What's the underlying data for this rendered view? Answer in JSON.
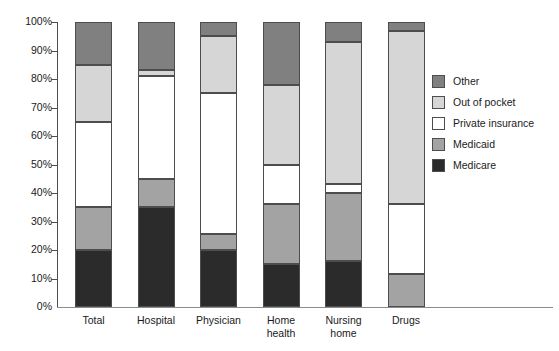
{
  "chart_data": {
    "type": "bar",
    "stacked": true,
    "title": "",
    "subtitle": "",
    "xlabel": "",
    "ylabel": "",
    "ylim": [
      0,
      100
    ],
    "grid": false,
    "legend_position": "right",
    "y_ticks": [
      "0%",
      "10%",
      "20%",
      "30%",
      "40%",
      "50%",
      "60%",
      "70%",
      "80%",
      "90%",
      "100%"
    ],
    "y_tick_values": [
      0,
      10,
      20,
      30,
      40,
      50,
      60,
      70,
      80,
      90,
      100
    ],
    "categories": [
      "Total",
      "Hospital",
      "Physician",
      "Home\nhealth",
      "Nursing\nhome",
      "Drugs"
    ],
    "series": [
      {
        "name": "Medicare",
        "color": "#2b2b2b",
        "values": [
          20,
          35,
          20,
          15,
          16,
          0
        ]
      },
      {
        "name": "Medicaid",
        "color": "#a3a3a3",
        "values": [
          15,
          10,
          5.5,
          21,
          24,
          11.5
        ]
      },
      {
        "name": "Private insurance",
        "color": "#ffffff",
        "values": [
          30,
          36,
          49.5,
          14,
          3,
          24.5
        ]
      },
      {
        "name": "Out of pocket",
        "color": "#d6d6d6",
        "values": [
          20,
          2,
          20,
          28,
          50,
          61
        ]
      },
      {
        "name": "Other",
        "color": "#808080",
        "values": [
          15,
          17,
          5,
          22,
          7,
          3
        ]
      }
    ],
    "cumulative_tops": {
      "Total": [
        20,
        35,
        65,
        85,
        100
      ],
      "Hospital": [
        35,
        45,
        81,
        83,
        100
      ],
      "Physician": [
        20,
        25.5,
        75,
        95,
        100
      ],
      "Home health": [
        15,
        36,
        50,
        78,
        100
      ],
      "Nursing home": [
        16,
        40,
        43,
        93,
        100
      ],
      "Drugs": [
        0,
        11.5,
        36,
        97,
        100
      ]
    }
  },
  "legend": {
    "items": [
      {
        "label": "Other",
        "color": "#808080"
      },
      {
        "label": "Out of pocket",
        "color": "#d6d6d6"
      },
      {
        "label": "Private insurance",
        "color": "#ffffff"
      },
      {
        "label": "Medicaid",
        "color": "#a3a3a3"
      },
      {
        "label": "Medicare",
        "color": "#2b2b2b"
      }
    ]
  },
  "colors": {
    "axis": "#4d4d4d",
    "baseline": "#8c8c8c",
    "text": "#1a1a1a",
    "background": "#ffffff",
    "bar_outline": "#4d4d4d"
  }
}
